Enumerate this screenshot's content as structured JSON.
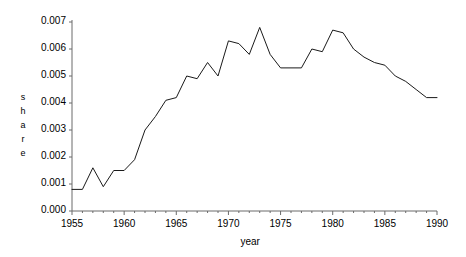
{
  "chart_data": {
    "type": "line",
    "title": "",
    "xlabel": "year",
    "ylabel": "share",
    "ylabel_chars": [
      "s",
      "h",
      "a",
      "r",
      "e"
    ],
    "xlim": [
      1955,
      1990
    ],
    "ylim": [
      0.0,
      0.007
    ],
    "grid": false,
    "legend": "none",
    "xticks": [
      1955,
      1960,
      1965,
      1970,
      1975,
      1980,
      1985,
      1990
    ],
    "xtick_labels": [
      "1955",
      "1960",
      "1965",
      "1970",
      "1975",
      "1980",
      "1985",
      "1990"
    ],
    "yticks": [
      0.0,
      0.001,
      0.002,
      0.003,
      0.004,
      0.005,
      0.006,
      0.007
    ],
    "ytick_labels": [
      "0.000",
      "0.001",
      "0.002",
      "0.003",
      "0.004",
      "0.005",
      "0.006",
      "0.007"
    ],
    "x": [
      1955,
      1956,
      1957,
      1958,
      1959,
      1960,
      1961,
      1962,
      1963,
      1964,
      1965,
      1966,
      1967,
      1968,
      1969,
      1970,
      1971,
      1972,
      1973,
      1974,
      1975,
      1976,
      1977,
      1978,
      1979,
      1980,
      1981,
      1982,
      1983,
      1984,
      1985,
      1986,
      1987,
      1988,
      1989,
      1990
    ],
    "values": [
      0.0008,
      0.0008,
      0.0016,
      0.0009,
      0.0015,
      0.0015,
      0.0019,
      0.003,
      0.0035,
      0.0041,
      0.0042,
      0.005,
      0.0049,
      0.0055,
      0.005,
      0.0063,
      0.0062,
      0.0058,
      0.0068,
      0.0058,
      0.0053,
      0.0053,
      0.0053,
      0.006,
      0.0059,
      0.0067,
      0.0066,
      0.006,
      0.0057,
      0.0055,
      0.0054,
      0.005,
      0.0048,
      0.0045,
      0.0042,
      0.0042
    ],
    "series_name": "share",
    "line_color": "#1a1a1a",
    "axis_color": "#555555",
    "background_color": "#ffffff"
  },
  "axis_title_x": "year"
}
